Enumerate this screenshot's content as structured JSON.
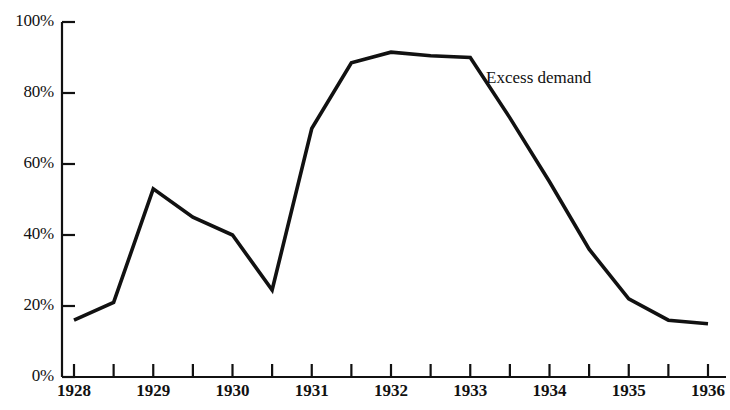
{
  "chart_data": {
    "type": "line",
    "title": "",
    "xlabel": "",
    "ylabel": "",
    "xlim": [
      1928,
      1936
    ],
    "ylim": [
      0,
      100
    ],
    "grid": false,
    "legend_position": "inline-annotation",
    "line_color": "#111111",
    "background_color": "#ffffff",
    "x": [
      1928,
      1928.5,
      1929,
      1929.5,
      1930,
      1930.5,
      1931,
      1931.5,
      1932,
      1932.5,
      1933,
      1933.5,
      1934,
      1934.5,
      1935,
      1935.5,
      1936
    ],
    "series": [
      {
        "name": "Excess demand",
        "values": [
          16,
          21,
          53,
          45,
          40,
          24.5,
          70,
          88.5,
          91.5,
          90.5,
          90,
          73,
          55,
          36,
          22,
          16,
          15
        ]
      }
    ],
    "annotations": [
      {
        "text": "Excess demand",
        "x": 1933.2,
        "y": 84
      }
    ],
    "y_ticks": [
      0,
      20,
      40,
      60,
      80,
      100
    ],
    "y_tick_labels": [
      "0%",
      "20%",
      "40%",
      "60%",
      "80%",
      "100%"
    ],
    "x_ticks": [
      1928,
      1928.5,
      1929,
      1929.5,
      1930,
      1930.5,
      1931,
      1931.5,
      1932,
      1932.5,
      1933,
      1933.5,
      1934,
      1934.5,
      1935,
      1935.5,
      1936
    ],
    "x_tick_labels": [
      "1928",
      "",
      "1929",
      "",
      "1930",
      "",
      "1931",
      "",
      "1932",
      "",
      "1933",
      "",
      "1934",
      "",
      "1935",
      "",
      "1936"
    ],
    "x_major_labels": [
      "1928",
      "1929",
      "1930",
      "1931",
      "1932",
      "1933",
      "1934",
      "1935",
      "1936"
    ]
  }
}
